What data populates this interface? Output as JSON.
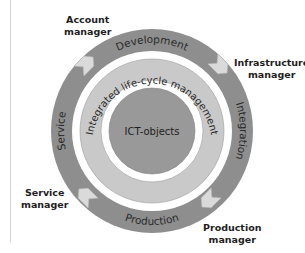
{
  "diagram": {
    "center": {
      "label": "ICT-objects"
    },
    "middle_ring": {
      "label": "Integrated life-cycle management"
    },
    "outer_ring": {
      "segments": [
        {
          "label": "Development",
          "position": "top"
        },
        {
          "label": "Integration",
          "position": "right"
        },
        {
          "label": "Production",
          "position": "bottom"
        },
        {
          "label": "Service",
          "position": "left"
        }
      ],
      "flow_direction": "clockwise"
    },
    "roles": [
      {
        "line1": "Account",
        "line2": "manager",
        "position": "top-left"
      },
      {
        "line1": "Infrastructure",
        "line2": "manager",
        "position": "top-right"
      },
      {
        "line1": "Production",
        "line2": "manager",
        "position": "bottom-right"
      },
      {
        "line1": "Service",
        "line2": "manager",
        "position": "bottom-left"
      }
    ],
    "colors": {
      "outer_ring": "#8e8e8e",
      "middle_ring": "#c9c9c9",
      "center": "#999999",
      "arrows": "#dadada",
      "gap": "#ffffff"
    }
  }
}
